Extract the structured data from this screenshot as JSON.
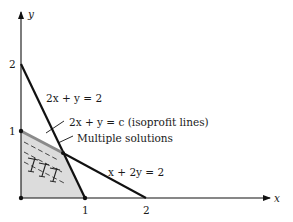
{
  "diagram": {
    "type": "linear-programming-graph",
    "axes": {
      "x_label": "x",
      "y_label": "y",
      "x_ticks": [
        "1",
        "2"
      ],
      "y_ticks": [
        "1",
        "2"
      ]
    },
    "constraints": [
      {
        "label": "2x + y = 2",
        "points": [
          [
            0,
            2
          ],
          [
            1,
            0
          ]
        ]
      },
      {
        "label": "x + 2y = 2",
        "points": [
          [
            0,
            1
          ],
          [
            2,
            0
          ]
        ]
      }
    ],
    "isoprofit_label": "2x + y = c (isoprofit lines)",
    "multiple_solutions_label": "Multiple solutions",
    "feasible_region_vertices": [
      [
        0,
        0
      ],
      [
        0,
        1
      ],
      [
        0.667,
        0.667
      ],
      [
        1,
        0
      ]
    ],
    "colors": {
      "region_fill": "#d9d9d9",
      "boundary": "#111111",
      "optimal_edge": "#8a8a8a"
    }
  }
}
